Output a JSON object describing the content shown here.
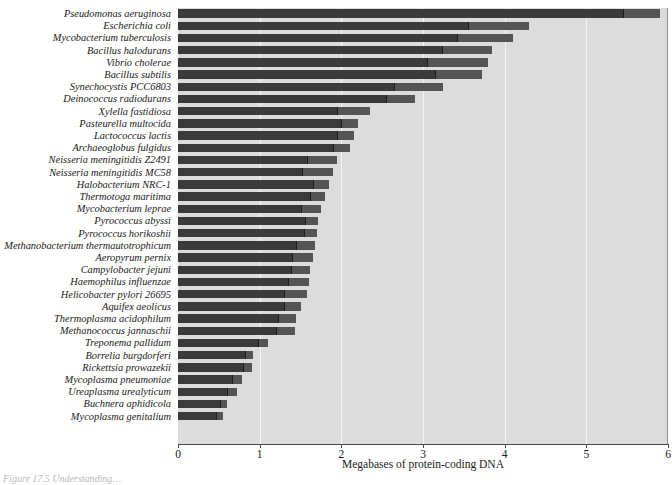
{
  "figure": {
    "caption": "Figure 17.5  Understanding…"
  },
  "chart_data": {
    "type": "bar",
    "orientation": "horizontal",
    "title": "",
    "subtitle": "",
    "xlabel": "Megabases of protein-coding DNA",
    "ylabel": "",
    "xlim": [
      0,
      6
    ],
    "xticks": [
      0,
      1,
      2,
      3,
      4,
      5,
      6
    ],
    "xtick_labels": [
      "0",
      "1",
      "2",
      "3",
      "4",
      "5",
      "6"
    ],
    "grid": "vertical",
    "legend": "none",
    "units": "Megabases",
    "categories": [
      "Pseudomonas aeruginosa",
      "Escherichia coli",
      "Mycobacterium tuberculosis",
      "Bacillus halodurans",
      "Vibrio cholerae",
      "Bacillus subtilis",
      "Synechocystis PCC6803",
      "Deinococcus radiodurans",
      "Xylella fastidiosa",
      "Pasteurella multocida",
      "Lactococcus lactis",
      "Archaeoglobus fulgidus",
      "Neisseria meningitidis Z2491",
      "Neisseria meningitidis MC58",
      "Halobacterium NRC-1",
      "Thermotoga maritima",
      "Mycobacterium leprae",
      "Pyrococcus abyssi",
      "Pyrococcus horikoshii",
      "Methanobacterium thermautotrophicum",
      "Aeropyrum pernix",
      "Campylobacter jejuni",
      "Haemophilus influenzae",
      "Helicobacter pylori 26695",
      "Aquifex aeolicus",
      "Thermoplasma acidophilum",
      "Methanococcus jannaschii",
      "Treponema pallidum",
      "Borrelia burgdorferi",
      "Rickettsia prowazekii",
      "Mycoplasma pneumoniae",
      "Ureaplasma urealyticum",
      "Buchnera aphidicola",
      "Mycoplasma genitalium"
    ],
    "values": [
      5.9,
      4.3,
      4.1,
      3.85,
      3.8,
      3.72,
      3.25,
      2.9,
      2.35,
      2.2,
      2.15,
      2.1,
      1.95,
      1.9,
      1.85,
      1.8,
      1.75,
      1.72,
      1.7,
      1.68,
      1.65,
      1.62,
      1.6,
      1.58,
      1.5,
      1.45,
      1.43,
      1.1,
      0.92,
      0.9,
      0.78,
      0.72,
      0.6,
      0.55
    ],
    "tip_values": [
      5.45,
      3.55,
      3.42,
      3.23,
      3.05,
      3.15,
      2.65,
      2.55,
      1.95,
      2.0,
      1.95,
      1.9,
      1.58,
      1.52,
      1.65,
      1.62,
      1.5,
      1.55,
      1.54,
      1.45,
      1.4,
      1.38,
      1.35,
      1.3,
      1.3,
      1.22,
      1.2,
      0.98,
      0.82,
      0.8,
      0.66,
      0.6,
      0.52,
      0.47
    ],
    "colors": {
      "bar": "#3a3a3a",
      "bar_tip": "#545454",
      "plot_background": "#dcdcdc",
      "gridline": "#f4f4f4",
      "axis": "#4a4a4a",
      "text": "#1a1a1a",
      "page_background": "#ffffff"
    }
  }
}
